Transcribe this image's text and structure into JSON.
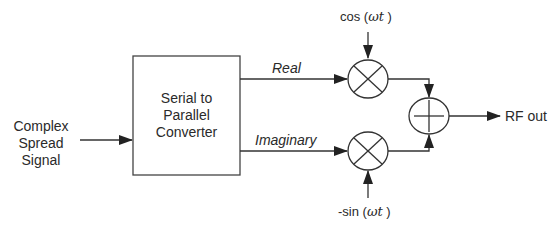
{
  "diagram": {
    "type": "block-diagram",
    "title": "",
    "input": {
      "line1": "Complex",
      "line2": "Spread",
      "line3": "Signal"
    },
    "converter": {
      "line1": "Serial to",
      "line2": "Parallel",
      "line3": "Converter"
    },
    "branches": {
      "real": "Real",
      "imaginary": "Imaginary"
    },
    "carriers": {
      "cos_prefix": "cos (",
      "cos_var": "ωt",
      "cos_suffix": " )",
      "sin_prefix": "-sin (",
      "sin_var": "ωt",
      "sin_suffix": " )"
    },
    "output": "RF out",
    "nodes": [
      {
        "id": "input",
        "label": "Complex Spread Signal"
      },
      {
        "id": "converter",
        "label": "Serial to Parallel Converter"
      },
      {
        "id": "mixer_real",
        "label": "multiplier (×)"
      },
      {
        "id": "mixer_imag",
        "label": "multiplier (×)"
      },
      {
        "id": "adder",
        "label": "summer (+)"
      },
      {
        "id": "output",
        "label": "RF out"
      }
    ],
    "edges": [
      {
        "from": "input",
        "to": "converter"
      },
      {
        "from": "converter",
        "to": "mixer_real",
        "label": "Real"
      },
      {
        "from": "converter",
        "to": "mixer_imag",
        "label": "Imaginary"
      },
      {
        "from": "cos (ωt)",
        "to": "mixer_real"
      },
      {
        "from": "-sin (ωt)",
        "to": "mixer_imag"
      },
      {
        "from": "mixer_real",
        "to": "adder"
      },
      {
        "from": "mixer_imag",
        "to": "adder"
      },
      {
        "from": "adder",
        "to": "output"
      }
    ],
    "colors": {
      "stroke": "#333333",
      "text": "#2a2a2a",
      "background": "#ffffff"
    }
  }
}
